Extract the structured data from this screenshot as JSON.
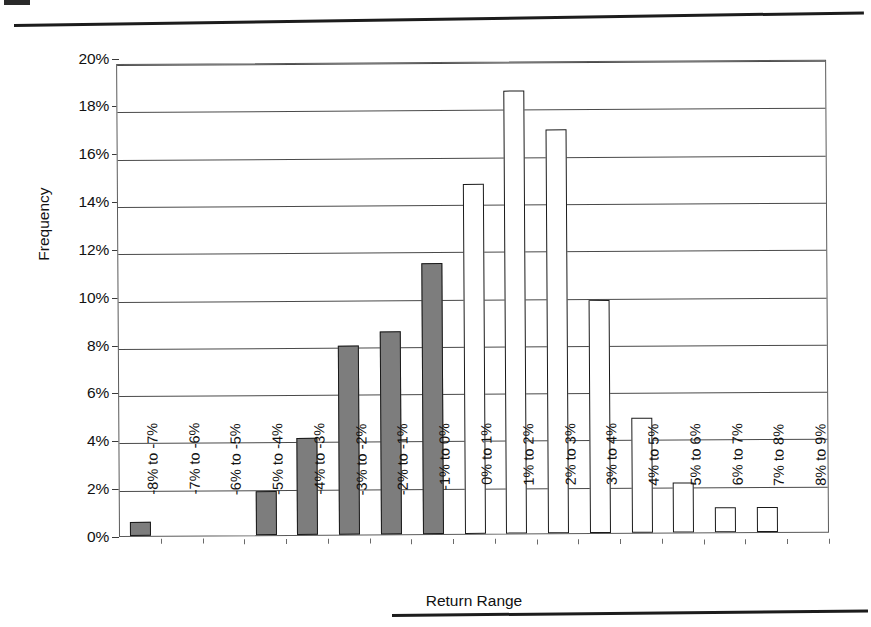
{
  "figure": {
    "y_axis_title": "Frequency",
    "x_axis_title": "Return Range"
  },
  "chart_data": {
    "type": "bar",
    "title": "",
    "subtitle": "",
    "xlabel": "Return Range",
    "ylabel": "Frequency",
    "ylim": [
      0,
      20
    ],
    "y_unit": "%",
    "ytick_labels": [
      "0%",
      "2%",
      "4%",
      "6%",
      "8%",
      "10%",
      "12%",
      "14%",
      "16%",
      "18%",
      "20%"
    ],
    "ytick_values": [
      0,
      2,
      4,
      6,
      8,
      10,
      12,
      14,
      16,
      18,
      20
    ],
    "grid": true,
    "grid_axis": "y",
    "legend": false,
    "legend_position": "none",
    "bar_styles": {
      "negative_fill": "#7d7d7d",
      "positive_fill": "#ffffff",
      "bar_border": "#1a1a1a"
    },
    "categories": [
      "-8% to -7%",
      "-7% to -6%",
      "-6% to -5%",
      "-5% to -4%",
      "-4% to -3%",
      "-3% to -2%",
      "-2% to -1%",
      "-1% to 0%",
      "0% to 1%",
      "1% to 2%",
      "2% to 3%",
      "3% to 4%",
      "4% to 5%",
      "5% to 6%",
      "6% to 7%",
      "7% to 8%",
      "8% to 9%"
    ],
    "values": [
      0.6,
      0,
      0,
      1.85,
      4.1,
      8.0,
      8.6,
      11.45,
      14.8,
      18.75,
      17.1,
      9.85,
      4.85,
      2.1,
      1.05,
      1.05,
      0
    ],
    "bar_fill_kinds": [
      "filled",
      "filled",
      "filled",
      "filled",
      "filled",
      "filled",
      "filled",
      "filled",
      "hollow",
      "hollow",
      "hollow",
      "hollow",
      "hollow",
      "hollow",
      "hollow",
      "hollow",
      "hollow"
    ]
  }
}
